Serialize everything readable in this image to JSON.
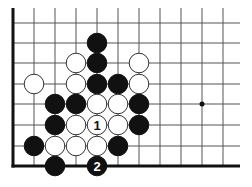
{
  "diagram": {
    "type": "go-board-fragment",
    "colors": {
      "black": "#111111",
      "white": "#ffffff",
      "line": "#555555",
      "edge": "#111111"
    },
    "grid": {
      "columns_x": [
        13,
        34,
        55,
        76,
        97,
        118,
        139,
        160,
        181,
        202,
        223
      ],
      "rows_y": [
        23,
        43,
        63,
        84,
        104,
        125,
        146,
        166
      ],
      "top_y": 8,
      "right_x": 240,
      "edges": [
        "left",
        "bottom"
      ]
    },
    "star_points": [
      {
        "col": 9,
        "row": 4
      }
    ],
    "stones": [
      {
        "color": "black",
        "col": 4,
        "row": 1
      },
      {
        "color": "white",
        "col": 3,
        "row": 2
      },
      {
        "color": "black",
        "col": 4,
        "row": 2
      },
      {
        "color": "white",
        "col": 6,
        "row": 2
      },
      {
        "color": "white",
        "col": 1,
        "row": 3
      },
      {
        "color": "white",
        "col": 3,
        "row": 3
      },
      {
        "color": "black",
        "col": 4,
        "row": 3
      },
      {
        "color": "black",
        "col": 5,
        "row": 3
      },
      {
        "color": "white",
        "col": 6,
        "row": 3
      },
      {
        "color": "black",
        "col": 2,
        "row": 4
      },
      {
        "color": "black",
        "col": 3,
        "row": 4
      },
      {
        "color": "white",
        "col": 4,
        "row": 4
      },
      {
        "color": "white",
        "col": 5,
        "row": 4
      },
      {
        "color": "black",
        "col": 6,
        "row": 4
      },
      {
        "color": "black",
        "col": 2,
        "row": 5
      },
      {
        "color": "white",
        "col": 3,
        "row": 5
      },
      {
        "color": "white",
        "col": 4,
        "row": 5,
        "label": "1"
      },
      {
        "color": "white",
        "col": 5,
        "row": 5
      },
      {
        "color": "black",
        "col": 6,
        "row": 5
      },
      {
        "color": "black",
        "col": 1,
        "row": 6
      },
      {
        "color": "white",
        "col": 2,
        "row": 6
      },
      {
        "color": "white",
        "col": 3,
        "row": 6
      },
      {
        "color": "white",
        "col": 4,
        "row": 6
      },
      {
        "color": "black",
        "col": 5,
        "row": 6
      },
      {
        "color": "black",
        "col": 2,
        "row": 7
      },
      {
        "color": "black",
        "col": 4,
        "row": 7,
        "label": "2"
      }
    ],
    "move_labels": [
      "1",
      "2"
    ]
  }
}
